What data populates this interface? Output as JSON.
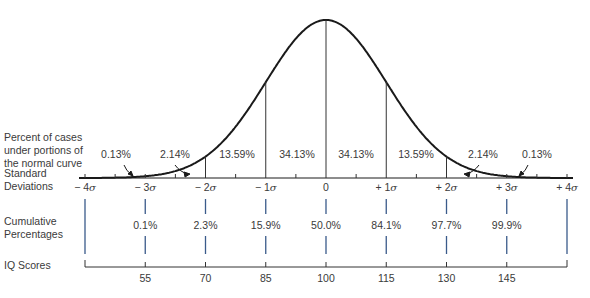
{
  "chart_data": {
    "type": "area",
    "row_labels": {
      "percent": [
        "Percent of cases",
        "under portions of",
        "the normal curve"
      ],
      "sd": [
        "Standard",
        "Deviations"
      ],
      "cumulative": [
        "Cumulative",
        "Percentages"
      ],
      "iq": "IQ Scores"
    },
    "segment_percentages": [
      {
        "label": "0.13%",
        "range": "-4σ to -3σ"
      },
      {
        "label": "2.14%",
        "range": "-3σ to -2σ"
      },
      {
        "label": "13.59%",
        "range": "-2σ to -1σ"
      },
      {
        "label": "34.13%",
        "range": "-1σ to 0"
      },
      {
        "label": "34.13%",
        "range": "0 to +1σ"
      },
      {
        "label": "13.59%",
        "range": "+1σ to +2σ"
      },
      {
        "label": "2.14%",
        "range": "+2σ to +3σ"
      },
      {
        "label": "0.13%",
        "range": "+3σ to +4σ"
      }
    ],
    "sd_ticks": [
      "− 4σ",
      "− 3σ",
      "− 2σ",
      "− 1σ",
      "0",
      "+ 1σ",
      "+ 2σ",
      "+ 3σ",
      "+ 4σ"
    ],
    "cumulative_percentages": [
      "",
      "0.1%",
      "2.3%",
      "15.9%",
      "50.0%",
      "84.1%",
      "97.7%",
      "99.9%",
      ""
    ],
    "iq_scores": [
      "",
      "55",
      "70",
      "85",
      "100",
      "115",
      "130",
      "145",
      ""
    ],
    "colors": {
      "curve": "#1a1a1a",
      "blue_ticks": "#3a5a8a",
      "text": "#3a3a3a"
    }
  }
}
